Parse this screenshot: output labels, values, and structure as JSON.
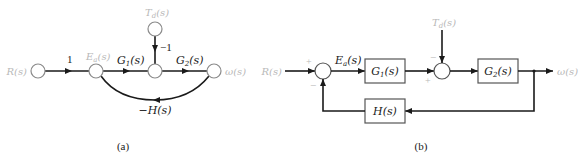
{
  "diagram_a": {
    "caption": "(a)",
    "type": "signal-flow-graph",
    "nodes": {
      "input": "R(s)",
      "error": "E_a(s)",
      "disturbance": "T_d(s)",
      "output": "ω(s)"
    },
    "node_labels": {
      "input_main": "R(s)",
      "error_main": "E",
      "error_sub": "a",
      "error_tail": "(s)",
      "disturbance_main": "T",
      "disturbance_sub": "d",
      "disturbance_tail": "(s)",
      "output_main": "ω(s)"
    },
    "branch_labels": {
      "input_gain": "1",
      "g1_main": "G",
      "g1_sub": "1",
      "g1_tail": "(s)",
      "g2_main": "G",
      "g2_sub": "2",
      "g2_tail": "(s)",
      "disturbance_gain": "−1",
      "feedback": "−H(s)"
    }
  },
  "diagram_b": {
    "caption": "(b)",
    "type": "block-diagram",
    "signals": {
      "input": "R(s)",
      "error_main": "E",
      "error_sub": "a",
      "error_tail": "(s)",
      "disturbance_main": "T",
      "disturbance_sub": "d",
      "disturbance_tail": "(s)",
      "output": "ω(s)"
    },
    "blocks": {
      "g1_main": "G",
      "g1_sub": "1",
      "g1_tail": "(s)",
      "g2_main": "G",
      "g2_sub": "2",
      "g2_tail": "(s)",
      "h": "H(s)"
    },
    "signs": {
      "sum1_input": "+",
      "sum1_feedback": "−",
      "sum2_disturbance": "−",
      "sum2_forward": "+"
    }
  }
}
